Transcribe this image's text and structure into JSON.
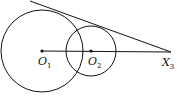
{
  "diagram": {
    "points": [
      {
        "id": "O1",
        "label": "O",
        "sub": "1",
        "x": 42,
        "y": 51
      },
      {
        "id": "O2",
        "label": "O",
        "sub": "2",
        "x": 91,
        "y": 51
      },
      {
        "id": "X3",
        "label": "X",
        "sub": "3",
        "x": 171,
        "y": 52
      }
    ],
    "circles": [
      {
        "center": "O1",
        "radius": 41
      },
      {
        "center": "O2",
        "radius": 25
      }
    ],
    "lines": [
      {
        "from": "O1",
        "to": "X3",
        "type": "segment"
      },
      {
        "from": [
          30,
          1
        ],
        "to": "X3",
        "type": "tangent"
      }
    ],
    "stroke_color": "#111111"
  }
}
